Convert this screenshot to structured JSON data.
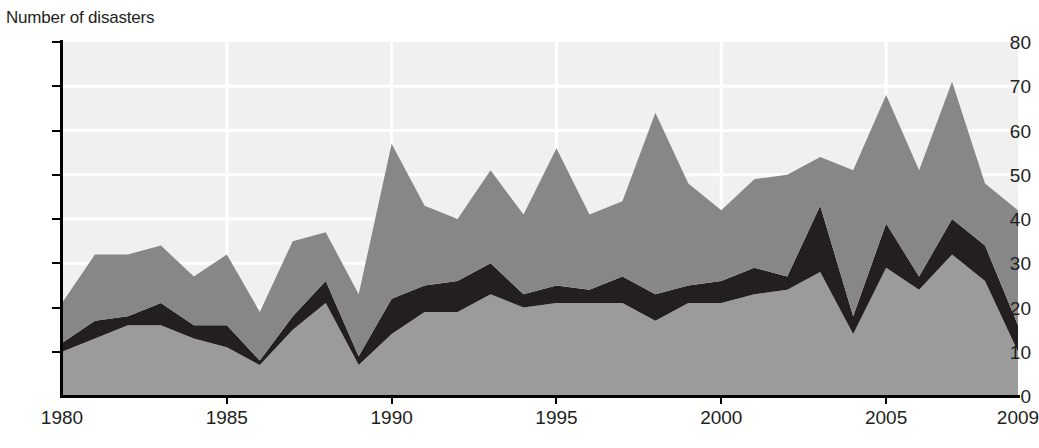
{
  "axis_title": "Number of disasters",
  "colors": {
    "series_bottom": "#9b9b9b",
    "series_middle": "#231f20",
    "series_top": "#878787",
    "plot_background": "#f0f0f0",
    "gridline": "#ffffff",
    "axis": "#000000",
    "text": "#231f20"
  },
  "chart_data": {
    "type": "area",
    "stacked": true,
    "title": "",
    "subtitle": "",
    "xlabel": "",
    "ylabel": "Number of disasters",
    "xlim": [
      1980,
      2009
    ],
    "ylim": [
      0,
      80
    ],
    "ytick_values": [
      0,
      10,
      20,
      30,
      40,
      50,
      60,
      70,
      80
    ],
    "ytick_labels": [
      "0",
      "10",
      "20",
      "30",
      "40",
      "50",
      "60",
      "70",
      "80"
    ],
    "xtick_values": [
      1980,
      1985,
      1990,
      1995,
      2000,
      2005,
      2009
    ],
    "xtick_labels": [
      "1980",
      "1985",
      "1990",
      "1995",
      "2000",
      "2005",
      "2009"
    ],
    "grid": {
      "vertical": true,
      "horizontal": true,
      "color": "#ffffff",
      "vertical_at": [
        1985,
        1990,
        1995,
        2000,
        2005
      ],
      "horizontal_at": [
        10,
        20,
        30,
        40,
        50,
        60,
        70
      ]
    },
    "legend": {
      "visible": false,
      "position": "none"
    },
    "x": [
      1980,
      1981,
      1982,
      1983,
      1984,
      1985,
      1986,
      1987,
      1988,
      1989,
      1990,
      1991,
      1992,
      1993,
      1994,
      1995,
      1996,
      1997,
      1998,
      1999,
      2000,
      2001,
      2002,
      2003,
      2004,
      2005,
      2006,
      2007,
      2008,
      2009
    ],
    "series": [
      {
        "name": "series-bottom",
        "values": [
          10,
          13,
          16,
          16,
          13,
          11,
          7,
          15,
          21,
          7,
          14,
          19,
          19,
          23,
          20,
          21,
          21,
          21,
          17,
          21,
          21,
          23,
          24,
          28,
          14,
          29,
          24,
          32,
          26,
          10
        ]
      },
      {
        "name": "series-middle",
        "values": [
          2,
          4,
          2,
          5,
          3,
          5,
          1,
          3,
          5,
          2,
          8,
          6,
          7,
          7,
          3,
          4,
          3,
          6,
          6,
          4,
          5,
          6,
          3,
          15,
          4,
          10,
          3,
          8,
          8,
          6
        ]
      },
      {
        "name": "series-top",
        "values": [
          9,
          15,
          14,
          13,
          11,
          16,
          11,
          17,
          11,
          14,
          35,
          18,
          14,
          21,
          18,
          31,
          17,
          17,
          41,
          23,
          16,
          20,
          23,
          11,
          33,
          29,
          24,
          31,
          14,
          26
        ]
      }
    ],
    "totals": [
      21,
      32,
      32,
      34,
      27,
      32,
      19,
      35,
      37,
      23,
      57,
      43,
      40,
      51,
      41,
      56,
      41,
      44,
      64,
      48,
      42,
      49,
      50,
      54,
      51,
      68,
      51,
      71,
      48,
      42
    ]
  }
}
